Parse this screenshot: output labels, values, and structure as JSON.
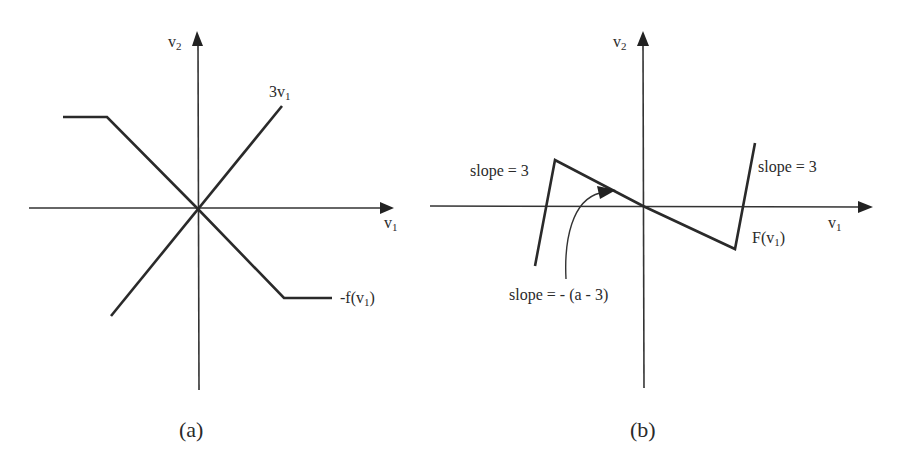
{
  "panel_a": {
    "caption": "(a)",
    "y_axis_label": "v",
    "y_axis_sub": "2",
    "x_axis_label": "v",
    "x_axis_sub": "1",
    "line1_label_main": "3v",
    "line1_label_sub": "1",
    "line2_label_prefix": "-f(v",
    "line2_label_sub": "1",
    "line2_label_suffix": ")"
  },
  "panel_b": {
    "caption": "(b)",
    "y_axis_label": "v",
    "y_axis_sub": "2",
    "x_axis_label": "v",
    "x_axis_sub": "1",
    "left_slope_label": "slope = 3",
    "right_slope_label": "slope = 3",
    "middle_slope_label": "slope = - (a - 3)",
    "curve_label_prefix": "F(v",
    "curve_label_sub": "1",
    "curve_label_suffix": ")"
  },
  "colors": {
    "line": "#2a2a2a",
    "background": "#ffffff"
  }
}
